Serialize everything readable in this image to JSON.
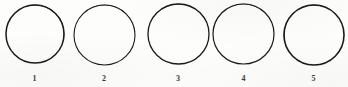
{
  "figure": {
    "kind": "line-drawing-plate",
    "background_color": "#fdfdfc",
    "stroke_color": "#1a1a1a",
    "label_color": "#3a3a3a",
    "width": 348,
    "height": 87,
    "circles": [
      {
        "label": "1",
        "cx": 34.5,
        "cy": 34.0,
        "rx": 29.0,
        "ry": 29.0,
        "stroke_width": 1.5,
        "label_x": 34.5,
        "label_y": 75.0
      },
      {
        "label": "2",
        "cx": 104.0,
        "cy": 34.5,
        "rx": 30.5,
        "ry": 30.0,
        "stroke_width": 1.1,
        "label_x": 104.0,
        "label_y": 75.0
      },
      {
        "label": "3",
        "cx": 178.0,
        "cy": 34.0,
        "rx": 30.5,
        "ry": 30.0,
        "stroke_width": 1.3,
        "label_x": 178.0,
        "label_y": 75.0
      },
      {
        "label": "4",
        "cx": 243.5,
        "cy": 34.0,
        "rx": 30.5,
        "ry": 30.0,
        "stroke_width": 1.2,
        "label_x": 243.5,
        "label_y": 75.0
      },
      {
        "label": "5",
        "cx": 313.5,
        "cy": 34.5,
        "rx": 30.0,
        "ry": 30.0,
        "stroke_width": 1.6,
        "label_x": 313.5,
        "label_y": 75.0
      }
    ]
  }
}
